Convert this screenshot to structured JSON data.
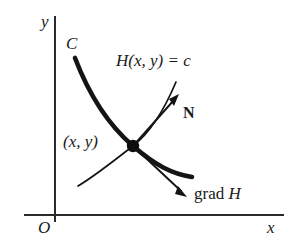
{
  "figure": {
    "kind": "math-diagram",
    "background_color": "#ffffff",
    "ink_color": "#1a1a1a",
    "axes": {
      "y_axis_label": "y",
      "x_axis_label": "x",
      "origin_label": "O"
    },
    "labels": {
      "curve_label": "C",
      "point_label": "(x, y)",
      "level_curve_label": "H(x, y) = c",
      "normal_vector_label": "N",
      "gradient_label_roman": "grad",
      "gradient_label_italic": "H"
    }
  }
}
